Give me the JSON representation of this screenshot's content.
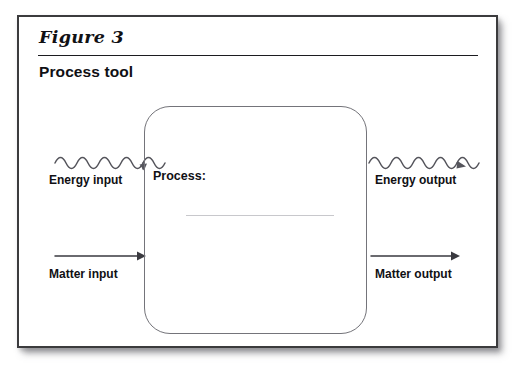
{
  "figure": {
    "label": "Figure 3",
    "title": "Process tool"
  },
  "process_box": {
    "label": "Process:",
    "fill_in_value": ""
  },
  "flows": {
    "energy_input": {
      "label": "Energy input",
      "icon": "wavy-arrow-right-icon",
      "direction": "into-process"
    },
    "energy_output": {
      "label": "Energy output",
      "icon": "wavy-arrow-right-icon",
      "direction": "out-of-process"
    },
    "matter_input": {
      "label": "Matter input",
      "icon": "straight-arrow-right-icon",
      "direction": "into-process"
    },
    "matter_output": {
      "label": "Matter output",
      "icon": "straight-arrow-right-icon",
      "direction": "out-of-process"
    }
  },
  "colors": {
    "card_border": "#3b3b3d",
    "text": "#101014",
    "box_border": "#74747a",
    "arrow": "#55555c",
    "blank_line": "#c8c8cc",
    "page_background": "#ffffff",
    "card_background": "#ffffff"
  }
}
